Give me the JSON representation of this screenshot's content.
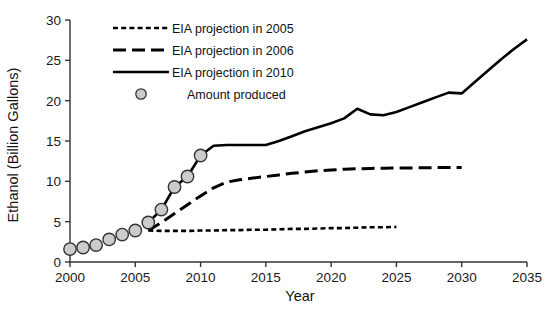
{
  "chart_data": {
    "type": "line",
    "title": "",
    "xlabel": "Year",
    "ylabel": "Ethanol (Billion Gallons)",
    "xlim": [
      2000,
      2035
    ],
    "ylim": [
      0,
      30
    ],
    "xticks": [
      "2000",
      "2005",
      "2010",
      "2015",
      "2020",
      "2025",
      "2030",
      "2035"
    ],
    "yticks": [
      "0",
      "5",
      "10",
      "15",
      "20",
      "25",
      "30"
    ],
    "grid": false,
    "legend_position": "top-left",
    "line_color": "#000000",
    "marker_fill": "#cccccc",
    "marker_stroke": "#333333",
    "series": [
      {
        "name": "EIA projection in 2005",
        "style": "dotted",
        "x": [
          2006,
          2007,
          2008,
          2009,
          2010,
          2011,
          2012,
          2013,
          2014,
          2015,
          2016,
          2017,
          2018,
          2019,
          2020,
          2021,
          2022,
          2023,
          2024,
          2025
        ],
        "values": [
          3.9,
          3.85,
          3.85,
          3.85,
          3.9,
          3.9,
          3.95,
          3.95,
          4.0,
          4.0,
          4.05,
          4.1,
          4.1,
          4.15,
          4.2,
          4.2,
          4.25,
          4.3,
          4.3,
          4.35
        ]
      },
      {
        "name": "EIA projection in 2006",
        "style": "dashed",
        "x": [
          2006,
          2007,
          2008,
          2009,
          2010,
          2011,
          2012,
          2013,
          2014,
          2015,
          2016,
          2017,
          2018,
          2019,
          2020,
          2021,
          2022,
          2023,
          2024,
          2025,
          2026,
          2027,
          2028,
          2029,
          2030
        ],
        "values": [
          3.9,
          4.9,
          6.0,
          7.1,
          8.2,
          9.2,
          9.9,
          10.2,
          10.4,
          10.6,
          10.8,
          11.0,
          11.15,
          11.3,
          11.4,
          11.5,
          11.55,
          11.6,
          11.62,
          11.65,
          11.67,
          11.68,
          11.7,
          11.7,
          11.7
        ]
      },
      {
        "name": "EIA projection in 2010",
        "style": "solid",
        "x": [
          2006,
          2007,
          2008,
          2009,
          2010,
          2011,
          2012,
          2013,
          2014,
          2015,
          2016,
          2017,
          2018,
          2019,
          2020,
          2021,
          2022,
          2023,
          2024,
          2025,
          2026,
          2027,
          2028,
          2029,
          2030,
          2031,
          2032,
          2033,
          2034,
          2035
        ],
        "values": [
          4.9,
          6.5,
          9.3,
          10.6,
          13.2,
          14.4,
          14.5,
          14.5,
          14.5,
          14.5,
          15.0,
          15.6,
          16.2,
          16.7,
          17.2,
          17.8,
          19.0,
          18.3,
          18.2,
          18.6,
          19.2,
          19.8,
          20.4,
          21.0,
          20.9,
          22.3,
          23.7,
          25.1,
          26.4,
          27.6
        ]
      }
    ],
    "scatter": {
      "name": "Amount produced",
      "x": [
        2000,
        2001,
        2002,
        2003,
        2004,
        2005,
        2006,
        2007,
        2008,
        2009,
        2010
      ],
      "values": [
        1.6,
        1.8,
        2.1,
        2.8,
        3.4,
        3.9,
        4.9,
        6.5,
        9.3,
        10.6,
        13.2
      ]
    },
    "legend": [
      {
        "label": "EIA projection in 2005",
        "style": "dotted"
      },
      {
        "label": "EIA projection in 2006",
        "style": "dashed"
      },
      {
        "label": "EIA projection in 2010",
        "style": "solid"
      },
      {
        "label": "Amount produced",
        "style": "marker"
      }
    ]
  }
}
